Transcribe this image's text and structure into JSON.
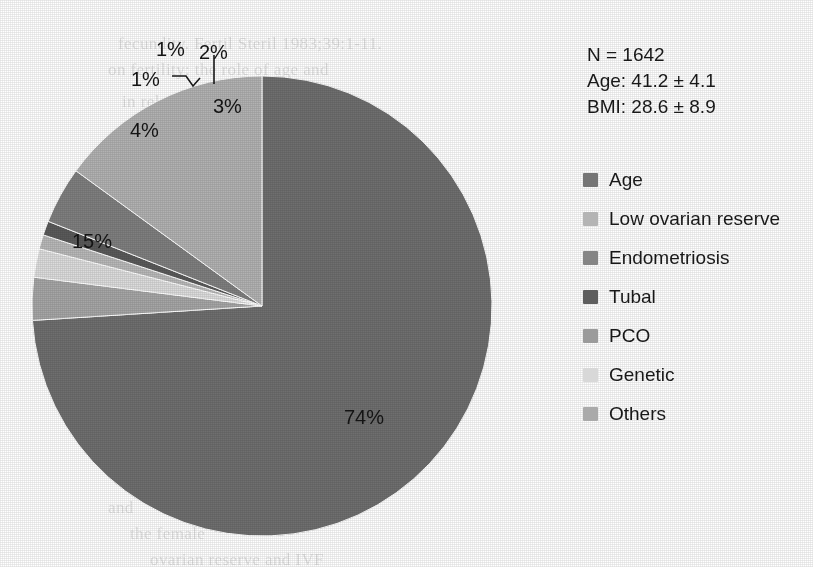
{
  "chart_data": {
    "type": "pie",
    "title": "",
    "xlabel": "",
    "ylabel": "",
    "legend_position": "right",
    "grid": false,
    "start_angle_deg": 0,
    "direction": "clockwise",
    "categories": [
      "Age",
      "Low ovarian reserve",
      "Endometriosis",
      "Tubal",
      "PCO",
      "Genetic",
      "Others"
    ],
    "values": [
      74,
      15,
      4,
      1,
      1,
      2,
      3
    ],
    "value_labels": [
      "74%",
      "15%",
      "4%",
      "1%",
      "1%",
      "2%",
      "3%"
    ],
    "unit": "%",
    "colors": [
      "#6f6f6f",
      "#b2b2b2",
      "#7f7f7f",
      "#5a5a5a",
      "#b8b8b8",
      "#dcdcdc",
      "#a6a6a6"
    ],
    "slices": [
      {
        "label": "Age",
        "value": 74,
        "value_label": "74%",
        "color": "#6f6f6f"
      },
      {
        "label": "Others",
        "value": 3,
        "value_label": "3%",
        "color": "#a6a6a6"
      },
      {
        "label": "Genetic",
        "value": 2,
        "value_label": "2%",
        "color": "#dcdcdc"
      },
      {
        "label": "PCO",
        "value": 1,
        "value_label": "1%",
        "color": "#b8b8b8"
      },
      {
        "label": "Tubal",
        "value": 1,
        "value_label": "1%",
        "color": "#5a5a5a"
      },
      {
        "label": "Endometriosis",
        "value": 4,
        "value_label": "4%",
        "color": "#7f7f7f"
      },
      {
        "label": "Low ovarian reserve",
        "value": 15,
        "value_label": "15%",
        "color": "#b2b2b2"
      }
    ]
  },
  "stats": {
    "n": "N = 1642",
    "age": "Age: 41.2 ± 4.1",
    "bmi": "BMI: 28.6 ± 8.9"
  },
  "legend": {
    "items": [
      {
        "label": "Age",
        "color": "#757575"
      },
      {
        "label": "Low ovarian reserve",
        "color": "#b4b4b4"
      },
      {
        "label": "Endometriosis",
        "color": "#858585"
      },
      {
        "label": "Tubal",
        "color": "#5e5e5e"
      },
      {
        "label": "PCO",
        "color": "#9b9b9b"
      },
      {
        "label": "Genetic",
        "color": "#d8d8d8"
      },
      {
        "label": "Others",
        "color": "#aaaaaa"
      }
    ]
  },
  "labels": {
    "pct_74": "74%",
    "pct_15": "15%",
    "pct_4": "4%",
    "pct_1a": "1%",
    "pct_1b": "1%",
    "pct_2": "2%",
    "pct_3": "3%"
  },
  "background_text": {
    "lines": [
      "fecundity. Fertil Steril 1983;39:1-11.",
      "on fertility: the role of age and",
      "in relation to age",
      "reproductive outcome",
      "and",
      "the female",
      "ovarian reserve and IVF"
    ]
  }
}
